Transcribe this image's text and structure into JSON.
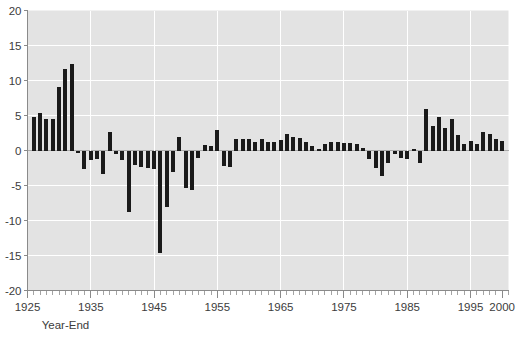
{
  "chart_data": {
    "type": "bar",
    "title": "",
    "subtitle": "",
    "xlabel": "Year-End",
    "ylabel": "",
    "grid": true,
    "legend": null,
    "xlim": [
      1925,
      2001
    ],
    "ylim": [
      -20,
      20
    ],
    "yticks": [
      20,
      15,
      10,
      5,
      0,
      -5,
      -10,
      -15,
      -20
    ],
    "ytick_labels": [
      "20",
      "15",
      "10",
      "5",
      "0",
      "-5",
      "-10",
      "-15",
      "-20"
    ],
    "xticks": [
      1925,
      1935,
      1945,
      1955,
      1965,
      1975,
      1985,
      1995,
      2000
    ],
    "xtick_labels": [
      "1925",
      "1935",
      "1945",
      "1955",
      "1965",
      "1975",
      "1985",
      "1995",
      "2000"
    ],
    "xtick_minor_step": 1,
    "bar_color": "#1a1a1a",
    "plot_background": "#e3e3e3",
    "gridline_color": "#ffffff",
    "categories": [
      1926,
      1927,
      1928,
      1929,
      1930,
      1931,
      1932,
      1933,
      1934,
      1935,
      1936,
      1937,
      1938,
      1939,
      1940,
      1941,
      1942,
      1943,
      1944,
      1945,
      1946,
      1947,
      1948,
      1949,
      1950,
      1951,
      1952,
      1953,
      1954,
      1955,
      1956,
      1957,
      1958,
      1959,
      1960,
      1961,
      1962,
      1963,
      1964,
      1965,
      1966,
      1967,
      1968,
      1969,
      1970,
      1971,
      1972,
      1973,
      1974,
      1975,
      1976,
      1977,
      1978,
      1979,
      1980,
      1981,
      1982,
      1983,
      1984,
      1985,
      1986,
      1987,
      1988,
      1989,
      1990,
      1991,
      1992,
      1993,
      1994,
      1995,
      1996,
      1997,
      1998,
      1999,
      2000
    ],
    "values": [
      4.8,
      5.3,
      4.5,
      4.5,
      9.1,
      11.7,
      12.4,
      -0.3,
      -2.6,
      -1.3,
      -1.2,
      -3.4,
      3.0,
      -0.6,
      -1.4,
      -8.8,
      -2.0,
      -2.4,
      -2.5,
      -2.7,
      -14.6,
      -8.1,
      -3.0,
      2.0,
      -5.5,
      -5.7,
      -1.0,
      0.8,
      0.6,
      -0.4,
      -2.7,
      -3.0,
      -1.5,
      -1.6,
      -1.4,
      -0.7,
      -1.2,
      -1.6,
      -1.0,
      -1.8,
      -3.0,
      -2.7,
      -4.2,
      -5.3,
      -5.5,
      -3.2,
      -3.3,
      -8.4,
      -11.8,
      -6.8,
      -4.7,
      -6.4,
      -8.8,
      -12.8,
      -12.2,
      -8.7,
      -3.7,
      -3.7,
      -3.9,
      -3.7,
      -1.1,
      -4.3,
      -4.4,
      -4.6,
      -6.1,
      -3.0,
      -2.8,
      -2.7,
      -2.6,
      -2.5,
      -3.2,
      -1.7,
      -1.6,
      -2.6,
      -3.3
    ],
    "display_values": [
      4.8,
      5.3,
      4.5,
      4.5,
      9.1,
      11.7,
      12.4,
      -0.4,
      -2.6,
      -1.3,
      -1.2,
      -3.4,
      2.6,
      -0.5,
      -1.4,
      -8.8,
      -2.0,
      -2.4,
      -2.5,
      -2.7,
      -14.6,
      -8.1,
      -3.0,
      1.9,
      -5.4,
      -5.6,
      -1.0,
      0.8,
      0.6,
      2.9,
      -2.2,
      -2.3,
      1.7,
      1.7,
      1.6,
      1.2,
      1.6,
      1.2,
      1.2,
      1.5,
      2.4,
      1.9,
      1.8,
      1.2,
      0.6,
      0.2,
      0.9,
      1.2,
      1.2,
      1.1,
      1.1,
      1.0,
      0.3,
      -1.2,
      -2.5,
      -3.7,
      -1.8,
      -0.5,
      -1.0,
      -1.2,
      0.2,
      -1.8,
      5.9,
      3.5,
      4.8,
      3.2,
      4.5,
      2.2,
      0.9,
      1.4,
      1.0,
      2.6,
      2.3,
      1.6,
      1.3
    ]
  }
}
